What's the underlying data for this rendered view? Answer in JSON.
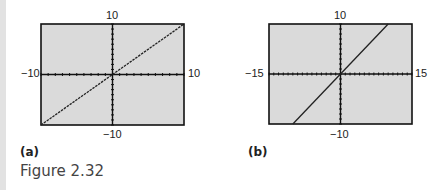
{
  "figure": {
    "caption": "Figure 2.32",
    "panels": [
      {
        "label": "(a)",
        "xmin": "−10",
        "xmax": "10",
        "ymin": "−10",
        "ymax": "10"
      },
      {
        "label": "(b)",
        "xmin": "−15",
        "xmax": "15",
        "ymin": "−10",
        "ymax": "10"
      }
    ]
  },
  "chart_data": [
    {
      "type": "line",
      "title": "(a)",
      "xlabel": "",
      "ylabel": "",
      "xlim": [
        -10,
        10
      ],
      "ylim": [
        -10,
        10
      ],
      "x_tick_spacing": 1,
      "y_tick_spacing": 1,
      "grid": false,
      "series": [
        {
          "name": "y = x",
          "x": [
            -10,
            10
          ],
          "y": [
            -10,
            10
          ]
        }
      ]
    },
    {
      "type": "line",
      "title": "(b)",
      "xlabel": "",
      "ylabel": "",
      "xlim": [
        -15,
        15
      ],
      "ylim": [
        -10,
        10
      ],
      "x_tick_spacing": 1,
      "y_tick_spacing": 1,
      "grid": false,
      "series": [
        {
          "name": "y = x",
          "x": [
            -10,
            10
          ],
          "y": [
            -10,
            10
          ]
        }
      ]
    }
  ]
}
